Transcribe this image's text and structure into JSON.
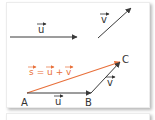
{
  "diagram": {
    "type": "vector-addition",
    "colors": {
      "vector": "#3a3a3a",
      "sum": "#e8703a",
      "text": "#333333"
    },
    "free_vectors": {
      "u": {
        "label": "u",
        "from": [
          10,
          37
        ],
        "to": [
          77,
          37
        ]
      },
      "v": {
        "label": "v",
        "from": [
          98,
          38
        ],
        "to": [
          131,
          8
        ]
      }
    },
    "points": {
      "A": {
        "label": "A",
        "pos": [
          27,
          93
        ]
      },
      "B": {
        "label": "B",
        "pos": [
          91,
          93
        ]
      },
      "C": {
        "label": "C",
        "pos": [
          120,
          62
        ]
      }
    },
    "triangle_labels": {
      "u": "u",
      "v": "v"
    },
    "sum_label": {
      "s": "s",
      "eq": " = ",
      "u": "u",
      "plus": " + ",
      "v": "v"
    }
  }
}
